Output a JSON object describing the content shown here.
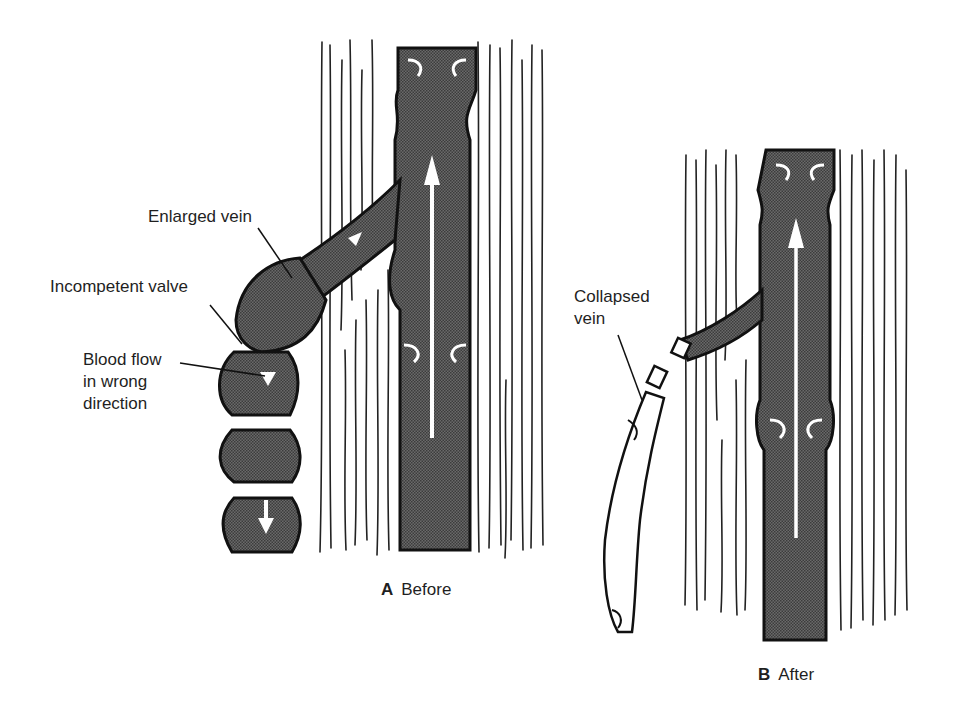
{
  "panels": [
    {
      "id": "A",
      "letter": "A",
      "caption": "Before",
      "labels": {
        "enlarged_vein": "Enlarged vein",
        "incompetent_valve": "Incompetent valve",
        "blood_flow_line1": "Blood flow",
        "blood_flow_line2": "in wrong",
        "blood_flow_line3": "direction"
      }
    },
    {
      "id": "B",
      "letter": "B",
      "caption": "After",
      "labels": {
        "collapsed_vein_line1": "Collapsed",
        "collapsed_vein_line2": "vein"
      }
    }
  ],
  "colors": {
    "vein_fill": "#5a5a5a",
    "outline": "#1a1a1a",
    "tissue_lines": "#2a2a2a",
    "background": "#ffffff",
    "arrow": "#ffffff"
  }
}
